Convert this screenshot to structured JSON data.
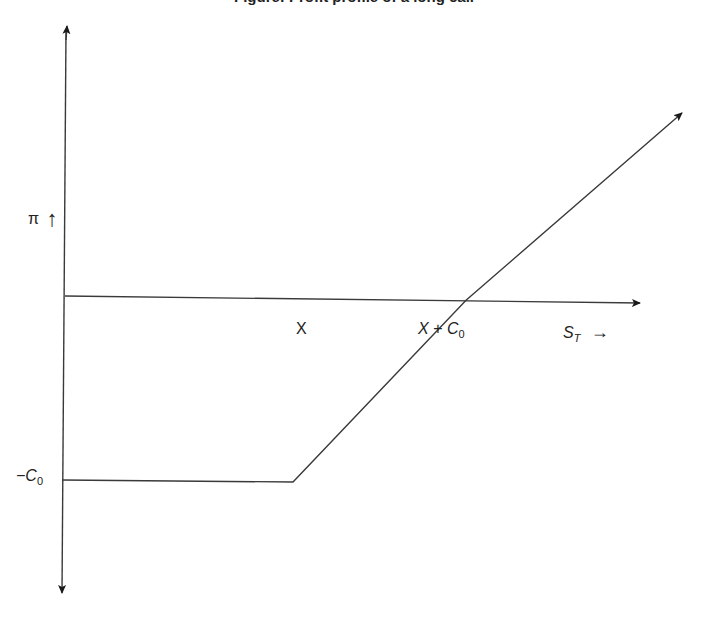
{
  "chart_data": {
    "type": "line",
    "title": "Figure: Profit profile of a long call",
    "title_visible_portion": "cropped at top edge; only descenders visible",
    "xlabel": "S_T",
    "ylabel": "π",
    "x_ticks": [
      {
        "label": "X",
        "value": 1
      },
      {
        "label": "X + C_0",
        "value": 1.75
      }
    ],
    "y_ticks": [
      {
        "label": "-C_0",
        "value": -1
      }
    ],
    "xlim": [
      0,
      2.7
    ],
    "ylim": [
      -1.6,
      1.5
    ],
    "grid": false,
    "legend": "none",
    "series": [
      {
        "name": "Long call profit",
        "points": [
          {
            "x": 0,
            "y": -1
          },
          {
            "x": 1,
            "y": -1
          },
          {
            "x": 1.75,
            "y": 0
          },
          {
            "x": 2.7,
            "y": 1.5
          }
        ],
        "end_arrow": true
      }
    ]
  },
  "labels": {
    "y_axis": "π",
    "y_axis_arrow": "↑",
    "x_axis": "S",
    "x_axis_sub": "T",
    "x_axis_arrow": "→",
    "strike": "X",
    "breakeven_main": "X + C",
    "breakeven_sub": "0",
    "premium_main": "−C",
    "premium_sub": "0"
  }
}
